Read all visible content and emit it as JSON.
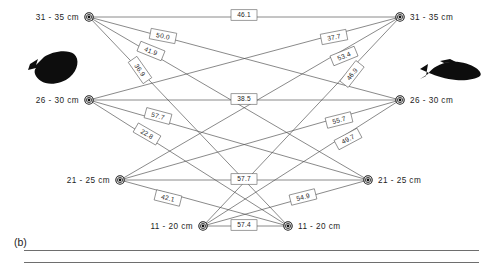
{
  "figure": {
    "panel_letter": "(b)",
    "width": 493,
    "height": 264
  },
  "species": [
    {
      "id": "flounder",
      "icon": "flatfish-silhouette-icon",
      "side": "left"
    },
    {
      "id": "cod",
      "icon": "cod-silhouette-icon",
      "side": "right"
    }
  ],
  "nodes": {
    "left": [
      {
        "id": "L1",
        "label": "31 - 35 cm",
        "x": 89,
        "y": 17
      },
      {
        "id": "L2",
        "label": "26 - 30 cm",
        "x": 89,
        "y": 100
      },
      {
        "id": "L3",
        "label": "21 - 25 cm",
        "x": 120,
        "y": 180
      },
      {
        "id": "L4",
        "label": "11 - 20  cm",
        "x": 203,
        "y": 226
      }
    ],
    "right": [
      {
        "id": "R1",
        "label": "31 - 35 cm",
        "x": 400,
        "y": 17
      },
      {
        "id": "R2",
        "label": "26 - 30 cm",
        "x": 400,
        "y": 100
      },
      {
        "id": "R3",
        "label": "21 - 25 cm",
        "x": 368,
        "y": 180
      },
      {
        "id": "R4",
        "label": "11 - 20  cm",
        "x": 288,
        "y": 226
      }
    ]
  },
  "chart_data": {
    "type": "diagram",
    "title": "",
    "edges": [
      {
        "from": "L1",
        "to": "R1",
        "value": "46.1",
        "label_x": 244,
        "label_y": 15,
        "angle": 0
      },
      {
        "from": "L1",
        "to": "R2",
        "value": "50.0",
        "label_x": 163,
        "label_y": 36,
        "angle": 11
      },
      {
        "from": "L1",
        "to": "R3",
        "value": "41.9",
        "label_x": 151,
        "label_y": 51,
        "angle": 22
      },
      {
        "from": "L1",
        "to": "R4",
        "value": "36.9",
        "label_x": 140,
        "label_y": 70,
        "angle": 55
      },
      {
        "from": "L2",
        "to": "R1",
        "value": "37.7",
        "label_x": 334,
        "label_y": 37,
        "angle": -11
      },
      {
        "from": "L2",
        "to": "R2",
        "value": "38.5",
        "label_x": 244,
        "label_y": 99,
        "angle": 0
      },
      {
        "from": "L2",
        "to": "R3",
        "value": "57.7",
        "label_x": 158,
        "label_y": 116,
        "angle": 15
      },
      {
        "from": "L2",
        "to": "R4",
        "value": "22.8",
        "label_x": 147,
        "label_y": 134,
        "angle": 30
      },
      {
        "from": "L3",
        "to": "R1",
        "value": "53.4",
        "label_x": 344,
        "label_y": 56,
        "angle": -22
      },
      {
        "from": "L3",
        "to": "R2",
        "value": "55.7",
        "label_x": 339,
        "label_y": 120,
        "angle": -14
      },
      {
        "from": "L3",
        "to": "R3",
        "value": "57.7",
        "label_x": 244,
        "label_y": 179,
        "angle": 0
      },
      {
        "from": "L3",
        "to": "R4",
        "value": "42.1",
        "label_x": 168,
        "label_y": 198,
        "angle": 14
      },
      {
        "from": "L4",
        "to": "R1",
        "value": "46.9",
        "label_x": 352,
        "label_y": 74,
        "angle": -52
      },
      {
        "from": "L4",
        "to": "R2",
        "value": "49.7",
        "label_x": 348,
        "label_y": 139,
        "angle": -28
      },
      {
        "from": "L4",
        "to": "R3",
        "value": "54.9",
        "label_x": 303,
        "label_y": 197,
        "angle": -14
      },
      {
        "from": "L4",
        "to": "R4",
        "value": "57.4",
        "label_x": 244,
        "label_y": 225,
        "angle": 0
      }
    ]
  }
}
